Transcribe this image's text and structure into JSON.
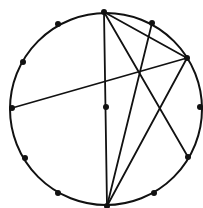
{
  "diagram": {
    "type": "circle-with-clock-points-and-chords",
    "circle": {
      "cx": 106,
      "cy": 109,
      "r": 96,
      "stroke": "#111111",
      "stroke_width": 2
    },
    "points": [
      {
        "id": "p12",
        "label": "12 o'clock",
        "x": 104,
        "y": 12
      },
      {
        "id": "p1",
        "label": "1 o'clock",
        "x": 152,
        "y": 23
      },
      {
        "id": "p2",
        "label": "2 o'clock",
        "x": 187,
        "y": 58
      },
      {
        "id": "p3",
        "label": "3 o'clock",
        "x": 200,
        "y": 107
      },
      {
        "id": "p4",
        "label": "4 o'clock",
        "x": 188,
        "y": 157
      },
      {
        "id": "p5",
        "label": "5 o'clock",
        "x": 154,
        "y": 193
      },
      {
        "id": "p6",
        "label": "6 o'clock",
        "x": 107,
        "y": 206
      },
      {
        "id": "p7",
        "label": "7 o'clock",
        "x": 58,
        "y": 193
      },
      {
        "id": "p8",
        "label": "8 o'clock",
        "x": 25,
        "y": 158
      },
      {
        "id": "p9",
        "label": "9 o'clock",
        "x": 12,
        "y": 108
      },
      {
        "id": "p10",
        "label": "10 o'clock",
        "x": 23,
        "y": 62
      },
      {
        "id": "p11",
        "label": "11 o'clock",
        "x": 58,
        "y": 24
      },
      {
        "id": "center",
        "label": "center",
        "x": 106,
        "y": 107
      }
    ],
    "chords": [
      {
        "from": "p12",
        "to": "p6"
      },
      {
        "from": "p12",
        "to": "p2"
      },
      {
        "from": "p12",
        "to": "p4"
      },
      {
        "from": "p1",
        "to": "p6"
      },
      {
        "from": "p2",
        "to": "p9"
      },
      {
        "from": "p2",
        "to": "p6"
      }
    ],
    "colors": {
      "line": "#111111",
      "dot": "#111111",
      "background": "#ffffff"
    },
    "dot_radius": 3,
    "line_width": 1.8
  }
}
